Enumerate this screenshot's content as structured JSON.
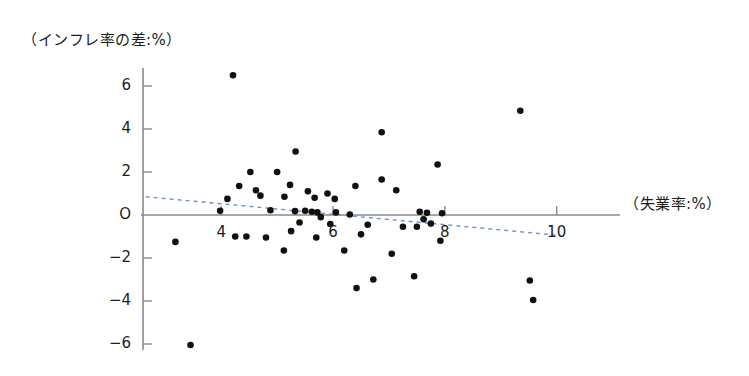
{
  "chart_data": {
    "type": "scatter",
    "title": "",
    "xlabel": "（失業率:%）",
    "ylabel": "（インフレ率の差:%）",
    "xlim": [
      2.6,
      10.4
    ],
    "ylim": [
      -6.8,
      7.2
    ],
    "xticks": [
      4,
      6,
      8,
      10
    ],
    "xtick_labels": [
      "4",
      "6",
      "8",
      "10"
    ],
    "yticks": [
      6,
      4,
      2,
      0,
      -2,
      -4,
      -6
    ],
    "ytick_labels": [
      "6",
      "4",
      "2",
      "O",
      "−2",
      "−4",
      "−6"
    ],
    "grid": false,
    "legend": null,
    "marker_color": "#111111",
    "axis_color": "#8a8a8a",
    "trend_color": "#6f93c4",
    "points": [
      [
        4.21,
        6.5
      ],
      [
        9.35,
        4.85
      ],
      [
        6.87,
        3.85
      ],
      [
        5.33,
        2.95
      ],
      [
        7.87,
        2.35
      ],
      [
        4.52,
        2.0
      ],
      [
        5.0,
        2.0
      ],
      [
        6.87,
        1.65
      ],
      [
        4.32,
        1.35
      ],
      [
        5.23,
        1.4
      ],
      [
        6.4,
        1.35
      ],
      [
        4.62,
        1.15
      ],
      [
        7.13,
        1.15
      ],
      [
        5.55,
        1.1
      ],
      [
        5.9,
        1.0
      ],
      [
        4.7,
        0.9
      ],
      [
        5.13,
        0.85
      ],
      [
        5.67,
        0.8
      ],
      [
        4.11,
        0.75
      ],
      [
        6.03,
        0.75
      ],
      [
        3.98,
        0.2
      ],
      [
        4.88,
        0.22
      ],
      [
        5.32,
        0.18
      ],
      [
        5.5,
        0.2
      ],
      [
        5.62,
        0.15
      ],
      [
        5.72,
        0.12
      ],
      [
        6.05,
        0.12
      ],
      [
        7.55,
        0.15
      ],
      [
        7.68,
        0.1
      ],
      [
        7.95,
        0.08
      ],
      [
        6.3,
        0.02
      ],
      [
        5.78,
        -0.1
      ],
      [
        7.62,
        -0.2
      ],
      [
        5.4,
        -0.35
      ],
      [
        5.95,
        -0.42
      ],
      [
        7.75,
        -0.4
      ],
      [
        6.62,
        -0.45
      ],
      [
        7.25,
        -0.55
      ],
      [
        7.5,
        -0.55
      ],
      [
        5.25,
        -0.75
      ],
      [
        6.5,
        -0.9
      ],
      [
        4.25,
        -1.0
      ],
      [
        4.45,
        -1.0
      ],
      [
        4.8,
        -1.05
      ],
      [
        5.7,
        -1.05
      ],
      [
        3.18,
        -1.25
      ],
      [
        7.92,
        -1.2
      ],
      [
        5.12,
        -1.65
      ],
      [
        6.2,
        -1.65
      ],
      [
        7.05,
        -1.8
      ],
      [
        9.52,
        -3.05
      ],
      [
        6.72,
        -3.0
      ],
      [
        7.45,
        -2.85
      ],
      [
        6.42,
        -3.4
      ],
      [
        9.58,
        -3.95
      ],
      [
        3.45,
        -6.05
      ]
    ],
    "trend": {
      "x0": 2.65,
      "y0": 0.85,
      "x1": 10.05,
      "y1": -0.95,
      "style": "dashed"
    }
  }
}
